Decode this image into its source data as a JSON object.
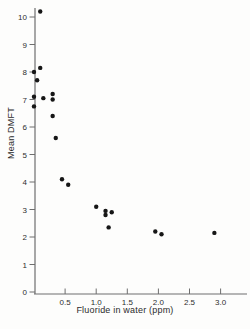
{
  "chart_data": {
    "type": "scatter",
    "title": "",
    "xlabel": "Fluoride in water (ppm)",
    "ylabel": "Mean DMFT",
    "xlim": [
      0,
      3.15
    ],
    "ylim": [
      0,
      10.5
    ],
    "x_ticks": [
      0.5,
      1.0,
      1.5,
      2.0,
      2.5,
      3.0
    ],
    "x_tick_labels": [
      "0.5",
      "1.0",
      "1.5",
      "2.0",
      "2.5",
      "3.0"
    ],
    "y_ticks": [
      0,
      1,
      2,
      3,
      4,
      5,
      6,
      7,
      8,
      9,
      10
    ],
    "y_tick_labels": [
      "0",
      "1",
      "2",
      "3",
      "4",
      "5",
      "6",
      "7",
      "8",
      "9",
      "10"
    ],
    "grid": false,
    "legend": null,
    "point_color": "#161616",
    "axis_color": "#6e6e6e",
    "points": [
      [
        0.1,
        10.2
      ],
      [
        0.1,
        8.15
      ],
      [
        0.0,
        8.0
      ],
      [
        0.05,
        7.7
      ],
      [
        0.3,
        7.2
      ],
      [
        0.0,
        7.1
      ],
      [
        0.15,
        7.05
      ],
      [
        0.3,
        7.0
      ],
      [
        0.0,
        6.75
      ],
      [
        0.3,
        6.4
      ],
      [
        0.35,
        5.6
      ],
      [
        0.45,
        4.1
      ],
      [
        0.55,
        3.9
      ],
      [
        1.0,
        3.1
      ],
      [
        1.15,
        2.95
      ],
      [
        1.25,
        2.9
      ],
      [
        1.15,
        2.8
      ],
      [
        1.2,
        2.35
      ],
      [
        1.95,
        2.2
      ],
      [
        2.9,
        2.15
      ],
      [
        2.05,
        2.1
      ]
    ]
  }
}
